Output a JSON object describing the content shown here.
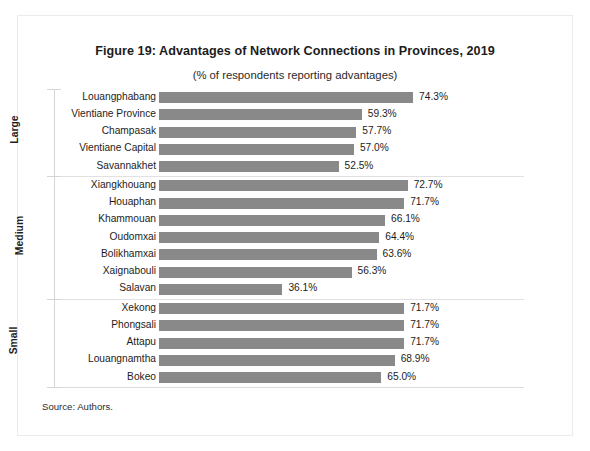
{
  "figure": {
    "title": "Figure 19: Advantages of Network Connections in Provinces, 2019",
    "subtitle": "(% of respondents reporting advantages)",
    "source": "Source: Authors."
  },
  "colors": {
    "bar": "#898989",
    "axis": "#d6d4d4",
    "text": "#1d1d1d"
  },
  "chart_data": {
    "type": "bar",
    "orientation": "horizontal",
    "title": "Figure 19: Advantages of Network Connections in Provinces, 2019",
    "subtitle": "(% of respondents reporting advantages)",
    "xlabel": "",
    "ylabel": "",
    "xlim": [
      0,
      80
    ],
    "grid": false,
    "legend": null,
    "value_suffix": "%",
    "groups": [
      {
        "name": "Large",
        "categories": [
          "Louangphabang",
          "Vientiane Province",
          "Champasak",
          "Vientiane Capital",
          "Savannakhet"
        ],
        "values": [
          74.3,
          59.3,
          57.7,
          57.0,
          52.5
        ],
        "labels": [
          "74.3%",
          "59.3%",
          "57.7%",
          "57.0%",
          "52.5%"
        ]
      },
      {
        "name": "Medium",
        "categories": [
          "Xiangkhouang",
          "Houaphan",
          "Khammouan",
          "Oudomxai",
          "Bolikhamxai",
          "Xaignabouli",
          "Salavan"
        ],
        "values": [
          72.7,
          71.7,
          66.1,
          64.4,
          63.6,
          56.3,
          36.1
        ],
        "labels": [
          "72.7%",
          "71.7%",
          "66.1%",
          "64.4%",
          "63.6%",
          "56.3%",
          "36.1%"
        ]
      },
      {
        "name": "Small",
        "categories": [
          "Xekong",
          "Phongsali",
          "Attapu",
          "Louangnamtha",
          "Bokeo"
        ],
        "values": [
          71.7,
          71.7,
          71.7,
          68.9,
          65.0
        ],
        "labels": [
          "71.7%",
          "71.7%",
          "71.7%",
          "68.9%",
          "65.0%"
        ]
      }
    ]
  }
}
